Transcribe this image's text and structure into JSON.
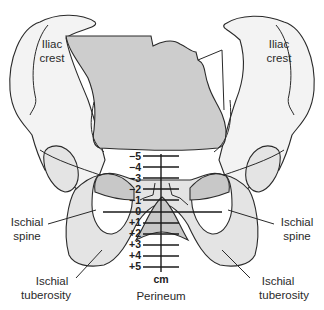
{
  "diagram": {
    "type": "pelvic station diagram (anterior view of pelvis)",
    "labels": {
      "iliac_crest_left": [
        "Iliac",
        "crest"
      ],
      "iliac_crest_right": [
        "Iliac",
        "crest"
      ],
      "ischial_spine_left": [
        "Ischial",
        "spine"
      ],
      "ischial_spine_right": [
        "Ischial",
        "spine"
      ],
      "ischial_tuberosity_left": [
        "Ischial",
        "tuberosity"
      ],
      "ischial_tuberosity_right": [
        "Ischial",
        "tuberosity"
      ],
      "perineum": "Perineum",
      "unit": "cm"
    },
    "station_scale": {
      "ticks": [
        "−5",
        "−4",
        "−3",
        "−2",
        "−1",
        "0",
        "+1",
        "+2",
        "+3",
        "+4",
        "+5"
      ],
      "unit": "cm"
    },
    "colors": {
      "bone_light": "#f3f3f3",
      "bone_mid": "#e4e4e4",
      "bone_dark": "#c8c8c8",
      "sacrum": "#cdcdcd",
      "outline": "#2a2a2a"
    }
  }
}
